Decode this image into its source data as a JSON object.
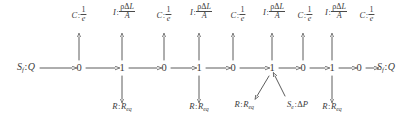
{
  "diagram": {
    "kind": "bond-graph",
    "colors": {
      "ink": "#3a3a3a",
      "bond": "#4a4a4a",
      "background": "#ffffff"
    },
    "chain": [
      {
        "id": "src-left",
        "type": "source",
        "label": "S_f:Q",
        "x": 26,
        "y": 68
      },
      {
        "id": "j0-1",
        "type": "junction",
        "label": "0",
        "x": 79,
        "y": 68
      },
      {
        "id": "j1-1",
        "type": "junction",
        "label": "1",
        "x": 122,
        "y": 68
      },
      {
        "id": "j0-2",
        "type": "junction",
        "label": "0",
        "x": 164,
        "y": 68
      },
      {
        "id": "j1-2",
        "type": "junction",
        "label": "1",
        "x": 199,
        "y": 68
      },
      {
        "id": "j0-3",
        "type": "junction",
        "label": "0",
        "x": 233,
        "y": 68
      },
      {
        "id": "j1-3",
        "type": "junction",
        "label": "1",
        "x": 272,
        "y": 68
      },
      {
        "id": "j0-4",
        "type": "junction",
        "label": "0",
        "x": 303,
        "y": 68
      },
      {
        "id": "j1-4",
        "type": "junction",
        "label": "1",
        "x": 332,
        "y": 68
      },
      {
        "id": "j0-5",
        "type": "junction",
        "label": "0",
        "x": 359,
        "y": 68
      },
      {
        "id": "src-right",
        "type": "source",
        "label": "S_f:Q",
        "x": 386,
        "y": 68
      }
    ],
    "elements_top": [
      {
        "id": "c1",
        "kind": "C",
        "prefix": "C",
        "num": "1",
        "den": "e",
        "x": 79,
        "label_y": 6,
        "bond_from_y": 60,
        "bond_to_y": 36
      },
      {
        "id": "i1",
        "kind": "I",
        "prefix": "I",
        "num": "ρΔL",
        "den": "A",
        "x": 122,
        "label_y": 3,
        "bond_from_y": 60,
        "bond_to_y": 36
      },
      {
        "id": "c2",
        "kind": "C",
        "prefix": "C",
        "num": "1",
        "den": "e",
        "x": 164,
        "label_y": 6,
        "bond_from_y": 60,
        "bond_to_y": 36
      },
      {
        "id": "i2",
        "kind": "I",
        "prefix": "I",
        "num": "ρΔL",
        "den": "A",
        "x": 201,
        "label_y": 3,
        "bond_from_y": 60,
        "bond_to_y": 36
      },
      {
        "id": "c3",
        "kind": "C",
        "prefix": "C",
        "num": "1",
        "den": "e",
        "x": 238,
        "label_y": 6,
        "bond_from_y": 60,
        "bond_to_y": 36
      },
      {
        "id": "i3",
        "kind": "I",
        "prefix": "I",
        "num": "ρΔL",
        "den": "A",
        "x": 272,
        "label_y": 3,
        "bond_from_y": 60,
        "bond_to_y": 36
      },
      {
        "id": "c4",
        "kind": "C",
        "prefix": "C",
        "num": "1",
        "den": "e",
        "x": 305,
        "label_y": 6,
        "bond_from_y": 60,
        "bond_to_y": 36
      },
      {
        "id": "i4",
        "kind": "I",
        "prefix": "I",
        "num": "ρΔL",
        "den": "A",
        "x": 334,
        "label_y": 3,
        "bond_from_y": 60,
        "bond_to_y": 36
      },
      {
        "id": "c5",
        "kind": "C",
        "prefix": "C",
        "num": "1",
        "den": "e",
        "x": 365,
        "label_y": 6,
        "bond_from_y": 60,
        "bond_to_y": 36
      }
    ],
    "elements_bottom": [
      {
        "id": "r1",
        "kind": "R",
        "text": "R:R_eq",
        "x": 122,
        "label_y": 106,
        "bond_from_y": 76,
        "bond_to_y": 100
      },
      {
        "id": "r2",
        "kind": "R",
        "text": "R:R_eq",
        "x": 199,
        "label_y": 106,
        "bond_from_y": 76,
        "bond_to_y": 100
      },
      {
        "id": "r3",
        "kind": "R",
        "text": "R:R_eq",
        "x": 252,
        "label_y": 103,
        "diagonal": true
      },
      {
        "id": "se",
        "kind": "Se",
        "text": "S_e:ΔP",
        "x": 282,
        "label_y": 103,
        "diagonal": true
      },
      {
        "id": "r4",
        "kind": "R",
        "text": "R:R_eq",
        "x": 332,
        "label_y": 106,
        "bond_from_y": 76,
        "bond_to_y": 100
      }
    ],
    "labels": {
      "source_flow_prefix": "S",
      "source_flow_sub": "f",
      "source_flow_var": "Q",
      "source_effort_prefix": "S",
      "source_effort_sub": "e",
      "source_effort_var": "ΔP",
      "resistance_prefix": "R",
      "resistance_var": "R",
      "resistance_sub": "eq",
      "capacitance_prefix": "C",
      "capacitance_num": "1",
      "capacitance_den": "e",
      "inertance_prefix": "I",
      "inertance_num": "ρΔL",
      "inertance_den": "A"
    }
  }
}
